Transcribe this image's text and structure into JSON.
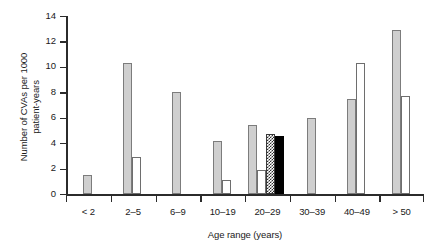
{
  "chart_data": {
    "type": "bar",
    "title": "",
    "subtitle": "",
    "xlabel": "Age range (years)",
    "ylabel": "Number of CVAs per 1000\npatient-years",
    "categories": [
      "< 2",
      "2–5",
      "6–9",
      "10–19",
      "20–29",
      "30–39",
      "40–49",
      "> 50"
    ],
    "ylim": [
      0,
      14
    ],
    "yticks": [
      0,
      2,
      4,
      6,
      8,
      10,
      12,
      14
    ],
    "ytick_labels": [
      "0",
      "2",
      "4",
      "6",
      "8",
      "10",
      "12",
      "14"
    ],
    "grid": false,
    "legend": "none",
    "series": [
      {
        "name": "gray-series",
        "style": "gray",
        "values": [
          1.5,
          10.3,
          8.0,
          4.2,
          5.4,
          6.0,
          7.5,
          12.9
        ]
      },
      {
        "name": "white-series",
        "style": "white",
        "values": [
          null,
          2.9,
          null,
          1.1,
          1.9,
          null,
          10.3,
          7.7
        ]
      },
      {
        "name": "hatched-series",
        "style": "hatch",
        "values": [
          null,
          null,
          null,
          null,
          4.7,
          null,
          null,
          null
        ]
      },
      {
        "name": "black-series",
        "style": "black",
        "values": [
          null,
          null,
          null,
          null,
          4.6,
          null,
          null,
          null
        ]
      }
    ]
  },
  "colors": {
    "gray_bar": "#cfcfcf",
    "gray_bar_edge": "#7c7c7c",
    "white_bar": "#ffffff",
    "white_bar_edge": "#6e6e6e",
    "black_bar": "#000000",
    "hatch_bar_edge": "#3a3a3a",
    "axis": "#2b2b2b",
    "text": "#1a1a1a",
    "background": "#ffffff"
  }
}
